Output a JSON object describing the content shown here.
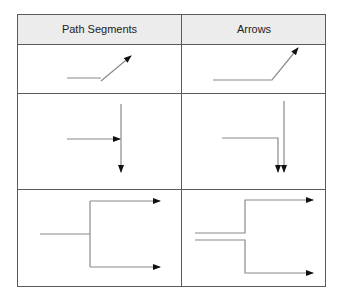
{
  "table": {
    "headers": [
      "Path Segments",
      "Arrows"
    ],
    "rows": [
      {
        "left": "segmented-diagonal-arrow",
        "right": "joined-diagonal-arrow"
      },
      {
        "left": "t-junction-arrows",
        "right": "parallel-down-arrows"
      },
      {
        "left": "branching-tree-arrows",
        "right": "split-parallel-arrows"
      }
    ]
  },
  "colors": {
    "border": "#5a5a5a",
    "header_bg": "#ececec",
    "line": "#8a8a8a",
    "arrowhead": "#111111"
  }
}
